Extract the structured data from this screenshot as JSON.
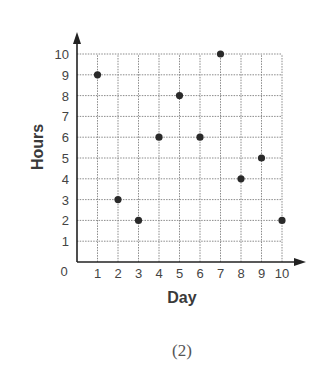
{
  "chart_data": {
    "type": "scatter",
    "title": "",
    "xlabel": "Day",
    "ylabel": "Hours",
    "caption": "(2)",
    "x_ticks": [
      1,
      2,
      3,
      4,
      5,
      6,
      7,
      8,
      9,
      10
    ],
    "y_ticks": [
      1,
      2,
      3,
      4,
      5,
      6,
      7,
      8,
      9,
      10
    ],
    "origin_label": "0",
    "xlim": [
      0,
      10
    ],
    "ylim": [
      0,
      10
    ],
    "grid": true,
    "legend": null,
    "series": [
      {
        "name": "Hours per Day",
        "points": [
          {
            "x": 1,
            "y": 9
          },
          {
            "x": 2,
            "y": 3
          },
          {
            "x": 3,
            "y": 2
          },
          {
            "x": 4,
            "y": 6
          },
          {
            "x": 5,
            "y": 8
          },
          {
            "x": 6,
            "y": 6
          },
          {
            "x": 7,
            "y": 10
          },
          {
            "x": 8,
            "y": 4
          },
          {
            "x": 9,
            "y": 5
          },
          {
            "x": 10,
            "y": 2
          }
        ]
      }
    ]
  },
  "colors": {
    "point": "#2a2a2a",
    "axis": "#222222",
    "grid": "#8a8a8a"
  }
}
